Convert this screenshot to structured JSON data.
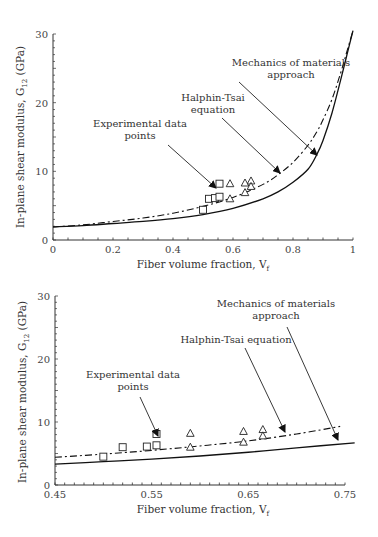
{
  "chart_data": [
    {
      "type": "line",
      "panel": "top",
      "title": "",
      "xlabel": "Fiber volume fraction, V_f",
      "ylabel": "In-plane shear modulus, G_12 (GPa)",
      "xlim": [
        0,
        1
      ],
      "ylim": [
        0,
        30
      ],
      "x_ticks": [
        "0",
        "0.2",
        "0.4",
        "0.6",
        "0.8",
        "1"
      ],
      "y_ticks": [
        "0",
        "10",
        "20",
        "30"
      ],
      "grid": false,
      "series": [
        {
          "name": "Mechanics of materials approach",
          "style": "solid",
          "x": [
            0,
            0.1,
            0.2,
            0.3,
            0.4,
            0.5,
            0.6,
            0.7,
            0.75,
            0.8,
            0.85,
            0.88,
            0.9,
            0.93,
            0.96,
            0.98,
            1.0
          ],
          "y": [
            1.9,
            2.1,
            2.4,
            2.7,
            3.1,
            3.7,
            4.6,
            6.0,
            7.0,
            8.4,
            10.3,
            12.5,
            14.5,
            18.5,
            23.5,
            27,
            30.5
          ]
        },
        {
          "name": "Halphin-Tsai equation",
          "style": "dashdot",
          "x": [
            0,
            0.1,
            0.2,
            0.3,
            0.4,
            0.5,
            0.6,
            0.7,
            0.75,
            0.8,
            0.85,
            0.88,
            0.9,
            0.93,
            0.96,
            0.98,
            1.0
          ],
          "y": [
            1.9,
            2.2,
            2.7,
            3.2,
            3.9,
            4.9,
            6.2,
            8.1,
            9.5,
            11.3,
            13.8,
            15.8,
            17.5,
            20.5,
            24.5,
            27.5,
            30.5
          ]
        },
        {
          "name": "Experimental data points (squares)",
          "style": "marker-square",
          "x": [
            0.5,
            0.52,
            0.54,
            0.555,
            0.555
          ],
          "y": [
            4.4,
            6.0,
            6.1,
            6.3,
            8.2
          ]
        },
        {
          "name": "Experimental data points (triangles)",
          "style": "marker-triangle",
          "x": [
            0.59,
            0.59,
            0.64,
            0.64,
            0.66,
            0.66
          ],
          "y": [
            8.2,
            6.0,
            8.3,
            6.9,
            8.6,
            7.8
          ]
        }
      ],
      "annotations": [
        {
          "text": [
            "Mechanics of materials",
            "approach"
          ],
          "arrow_to": [
            0.88,
            11.5
          ]
        },
        {
          "text": [
            "Halphin-Tsai",
            "equation"
          ],
          "arrow_to": [
            0.76,
            9.6
          ]
        },
        {
          "text": [
            "Experimental data",
            "points"
          ],
          "arrow_to": [
            0.55,
            8.0
          ]
        }
      ]
    },
    {
      "type": "line",
      "panel": "bottom",
      "title": "",
      "xlabel": "Fiber volume fraction, V_f",
      "ylabel": "In-plane shear modulus, G_12 (GPa)",
      "xlim": [
        0.45,
        0.75
      ],
      "ylim": [
        0,
        30
      ],
      "x_ticks": [
        "0.45",
        "0.55",
        "0.65",
        "0.75"
      ],
      "y_ticks": [
        "0",
        "10",
        "20",
        "30"
      ],
      "grid": false,
      "series": [
        {
          "name": "Mechanics of materials approach",
          "style": "solid",
          "x": [
            0.45,
            0.5,
            0.55,
            0.6,
            0.65,
            0.7,
            0.76
          ],
          "y": [
            3.3,
            3.7,
            4.1,
            4.6,
            5.2,
            5.9,
            6.7
          ]
        },
        {
          "name": "Halphin-Tsai equation",
          "style": "dashdot",
          "x": [
            0.45,
            0.5,
            0.55,
            0.6,
            0.65,
            0.7,
            0.745
          ],
          "y": [
            4.4,
            4.9,
            5.5,
            6.2,
            7.0,
            8.1,
            9.3
          ]
        },
        {
          "name": "Experimental data points (squares)",
          "style": "marker-square",
          "x": [
            0.5,
            0.52,
            0.545,
            0.555,
            0.555
          ],
          "y": [
            4.5,
            6.0,
            6.1,
            6.3,
            8.1
          ]
        },
        {
          "name": "Experimental data points (triangles)",
          "style": "marker-triangle",
          "x": [
            0.59,
            0.59,
            0.645,
            0.645,
            0.665,
            0.665
          ],
          "y": [
            8.2,
            6.0,
            8.5,
            6.8,
            8.8,
            7.8
          ]
        }
      ],
      "annotations": [
        {
          "text": [
            "Mechanics of materials",
            "approach"
          ],
          "arrow_to": [
            0.74,
            6.5
          ]
        },
        {
          "text": [
            "Halphin-Tsai equation"
          ],
          "arrow_to": [
            0.69,
            8.0
          ]
        },
        {
          "text": [
            "Experimental data",
            "points"
          ],
          "arrow_to": [
            0.555,
            7.8
          ]
        }
      ]
    }
  ],
  "labels": {
    "top_ylabel": "In-plane shear modulus, G",
    "ylabel_sub": "12",
    "ylabel_unit": " (GPa)",
    "xlabel": "Fiber volume fraction, V",
    "xlabel_sub": "f",
    "top_mech_1": "Mechanics of materials",
    "top_mech_2": "approach",
    "top_ht_1": "Halphin-Tsai",
    "top_ht_2": "equation",
    "top_exp_1": "Experimental data",
    "top_exp_2": "points",
    "bot_mech_1": "Mechanics of materials",
    "bot_mech_2": "approach",
    "bot_ht_1": "Halphin-Tsai equation",
    "bot_exp_1": "Experimental data",
    "bot_exp_2": "points"
  }
}
